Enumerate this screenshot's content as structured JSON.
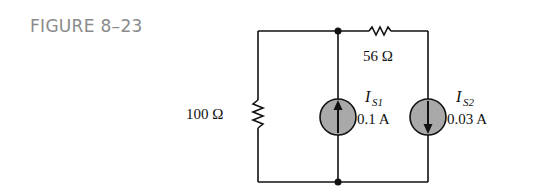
{
  "figure": {
    "label": "FIGURE 8–23"
  },
  "components": {
    "r_series": {
      "value": "56 Ω"
    },
    "r_shunt": {
      "value": "100 Ω"
    },
    "source1": {
      "symbol": "I",
      "subscript": "S1",
      "value": "0.1 A",
      "direction": "up"
    },
    "source2": {
      "symbol": "I",
      "subscript": "S2",
      "value": "0.03 A",
      "direction": "down"
    }
  },
  "colors": {
    "wire": "#111111",
    "source_fill": "#a9a9a9",
    "label_gray": "#8a8a8a"
  }
}
